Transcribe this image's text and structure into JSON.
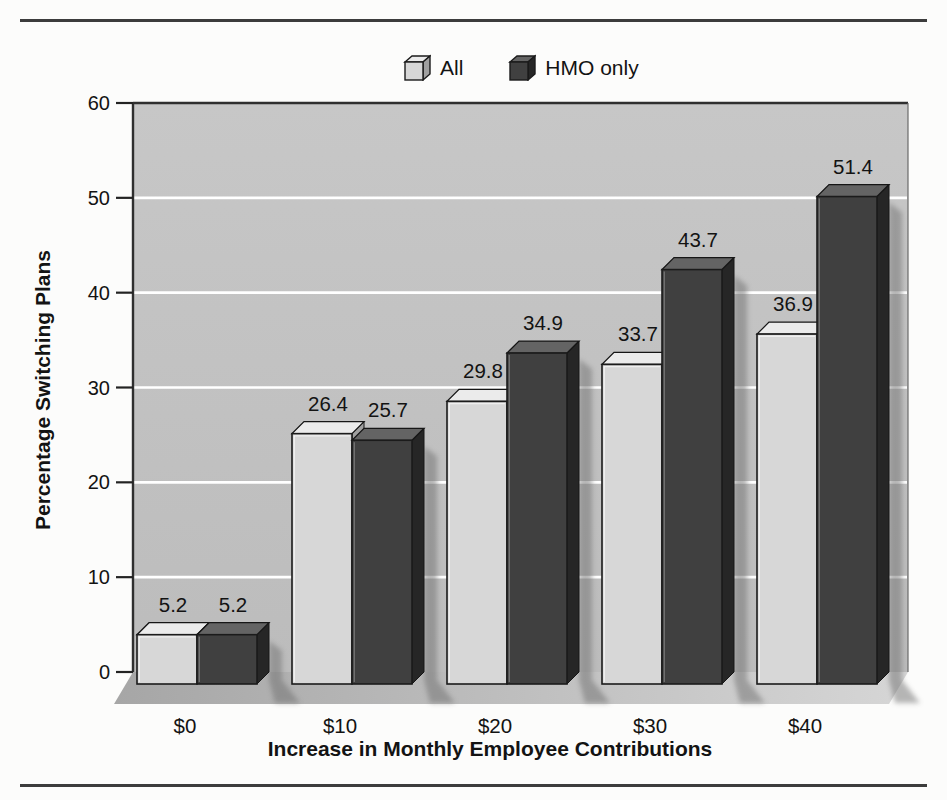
{
  "legend": {
    "items": [
      {
        "label": "All"
      },
      {
        "label": "HMO only"
      }
    ]
  },
  "chart_data": {
    "type": "bar",
    "style": "3d-perspective-grouped",
    "categories": [
      "$0",
      "$10",
      "$20",
      "$30",
      "$40"
    ],
    "series": [
      {
        "name": "All",
        "values": [
          5.2,
          26.4,
          29.8,
          33.7,
          36.9
        ]
      },
      {
        "name": "HMO only",
        "values": [
          5.2,
          25.7,
          34.9,
          43.7,
          51.4
        ]
      }
    ],
    "data_labels": true,
    "xlabel": "Increase in Monthly Employee Contributions",
    "ylabel": "Percentage Switching Plans",
    "ylim": [
      0,
      60
    ],
    "yticks": [
      0,
      10,
      20,
      30,
      40,
      50,
      60
    ],
    "grid": "horizontal-white-lines",
    "legend_position": "top-center"
  },
  "colors": {
    "all_front": "#d7d7d7",
    "all_top": "#ebebeb",
    "all_side": "#a0a0a0",
    "hmo_front": "#404040",
    "hmo_top": "#646464",
    "hmo_side": "#262626",
    "wall_top": "#c7c7c7",
    "wall_bottom": "#bcbcbc",
    "gridline": "#ffffff",
    "outline": "#1b1b1b",
    "floor_left": "#a6a6a6",
    "floor_right": "#d6d6d6",
    "shadow": "#6f6f6f",
    "rule": "#3c3c3c",
    "text": "#131313"
  }
}
